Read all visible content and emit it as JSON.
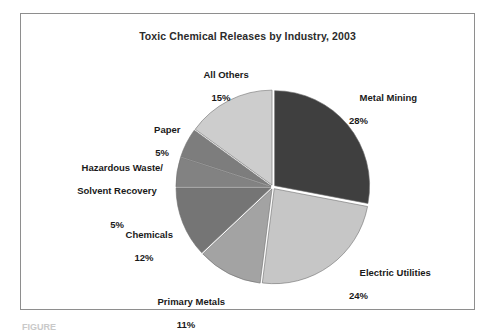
{
  "figure": {
    "title": "Toxic Chemical Releases by Industry, 2003",
    "background_color": "#ffffff",
    "border_color": "#8e8e8e"
  },
  "chart_data": {
    "type": "pie",
    "title": "Toxic Chemical Releases by Industry, 2003",
    "xlabel": "",
    "ylabel": "",
    "units": "percent",
    "total": 100,
    "start_angle_deg": 0,
    "direction": "clockwise",
    "legend_position": "none",
    "grid": false,
    "categories": [
      "Metal Mining",
      "Electric Utilities",
      "Primary Metals",
      "Chemicals",
      "Hazardous Waste/ Solvent Recovery",
      "Paper",
      "All Others"
    ],
    "values": [
      28,
      24,
      11,
      12,
      5,
      5,
      15
    ],
    "slices": [
      {
        "label": "Metal Mining",
        "label_line1": "Metal Mining",
        "label_line2": "28%",
        "value": 28,
        "value_text": "28%",
        "color": "#3f3f3f",
        "start_deg": 0,
        "end_deg": 100.8
      },
      {
        "label": "Electric Utilities",
        "label_line1": "Electric Utilities",
        "label_line2": "24%",
        "value": 24,
        "value_text": "24%",
        "color": "#c6c6c6",
        "start_deg": 100.8,
        "end_deg": 187.2
      },
      {
        "label": "Primary Metals",
        "label_line1": "Primary Metals",
        "label_line2": "11%",
        "value": 11,
        "value_text": "11%",
        "color": "#a3a3a3",
        "start_deg": 187.2,
        "end_deg": 226.8
      },
      {
        "label": "Chemicals",
        "label_line1": "Chemicals",
        "label_line2": "12%",
        "value": 12,
        "value_text": "12%",
        "color": "#757575",
        "start_deg": 226.8,
        "end_deg": 270.0
      },
      {
        "label": "Hazardous Waste/ Solvent Recovery",
        "label_line1": "Hazardous Waste/",
        "label_line2": "Solvent Recovery",
        "label_line3": "5%",
        "value": 5,
        "value_text": "5%",
        "color": "#828282",
        "start_deg": 270.0,
        "end_deg": 288.0
      },
      {
        "label": "Paper",
        "label_line1": "Paper",
        "label_line2": "5%",
        "value": 5,
        "value_text": "5%",
        "color": "#7d7d7d",
        "start_deg": 288.0,
        "end_deg": 306.0
      },
      {
        "label": "All Others",
        "label_line1": "All Others",
        "label_line2": "15%",
        "value": 15,
        "value_text": "15%",
        "color": "#cdcdcd",
        "start_deg": 306.0,
        "end_deg": 360.0
      }
    ]
  },
  "caption": {
    "text": "FIGURE"
  }
}
